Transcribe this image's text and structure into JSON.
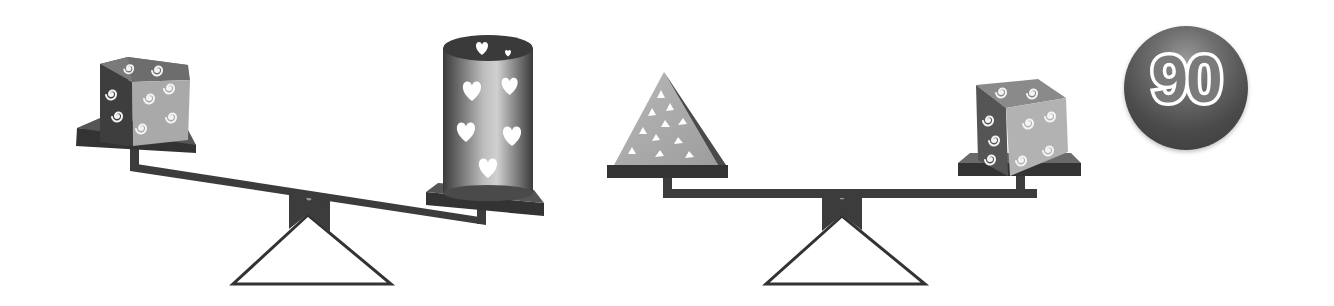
{
  "puzzle": {
    "number": "90",
    "colors": {
      "background": "#ffffff",
      "scale_dark": "#3c3c3c",
      "badge": "#4a4a4a",
      "badge_text": "#ffffff"
    },
    "scales": [
      {
        "id": "left",
        "state": "tilted-right-down",
        "left_pan": {
          "object": "swirl-cube",
          "count": 1
        },
        "right_pan": {
          "object": "heart-cylinder",
          "count": 1
        }
      },
      {
        "id": "right",
        "state": "balanced",
        "left_pan": {
          "object": "triangle-pyramid",
          "count": 1
        },
        "right_pan": {
          "object": "swirl-cube",
          "count": 1
        }
      }
    ]
  }
}
